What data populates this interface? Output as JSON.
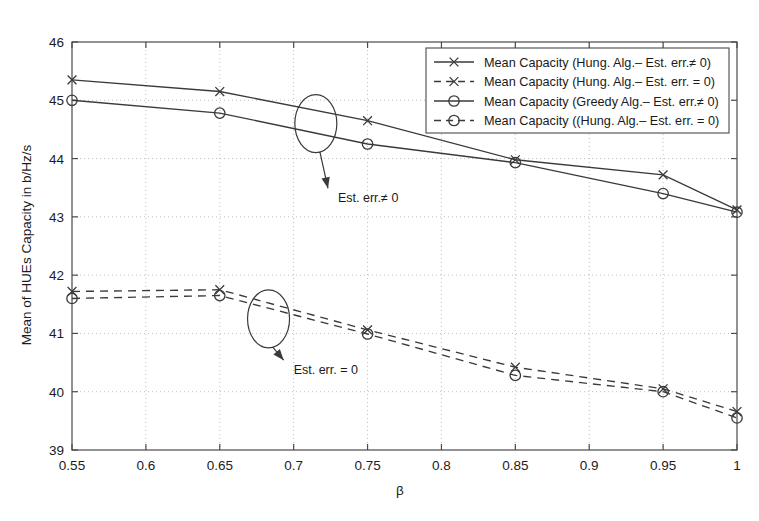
{
  "chart_data": {
    "type": "line",
    "title": "",
    "xlabel": "β",
    "ylabel": "Mean of HUEs Capacity in b/Hz/s",
    "xlim": [
      0.55,
      1.0
    ],
    "ylim": [
      39,
      46
    ],
    "xticks": [
      0.55,
      0.6,
      0.65,
      0.7,
      0.75,
      0.8,
      0.85,
      0.9,
      0.95,
      1.0
    ],
    "xticklabels": [
      "0.55",
      "0.6",
      "0.65",
      "0.7",
      "0.75",
      "0.8",
      "0.85",
      "0.9",
      "0.95",
      "1"
    ],
    "yticks": [
      39,
      40,
      41,
      42,
      43,
      44,
      45,
      46
    ],
    "yticklabels": [
      "39",
      "40",
      "41",
      "42",
      "43",
      "44",
      "45",
      "46"
    ],
    "grid": true,
    "grid_style": "dotted",
    "legend_position": "upper right",
    "x": [
      0.55,
      0.65,
      0.75,
      0.85,
      0.95,
      1.0
    ],
    "series": [
      {
        "name": "Mean Capacity (Hung. Alg.– Est. err.≠ 0)",
        "marker": "x",
        "linestyle": "solid",
        "values": [
          45.35,
          45.15,
          44.65,
          43.98,
          43.72,
          43.12
        ]
      },
      {
        "name": "Mean Capacity (Hung. Alg.– Est. err. = 0)",
        "marker": "x",
        "linestyle": "dashed",
        "values": [
          41.72,
          41.75,
          41.06,
          40.42,
          40.05,
          39.66
        ]
      },
      {
        "name": "Mean Capacity (Greedy Alg.– Est. err.≠ 0)",
        "marker": "o",
        "linestyle": "solid",
        "values": [
          45.0,
          44.78,
          44.25,
          43.93,
          43.4,
          43.08
        ]
      },
      {
        "name": "Mean Capacity ((Hung. Alg.– Est. err. = 0)",
        "marker": "o",
        "linestyle": "dashed",
        "values": [
          41.6,
          41.65,
          40.99,
          40.28,
          40.0,
          39.55
        ]
      }
    ],
    "annotations": [
      {
        "text": "Est. err.≠ 0",
        "x": 0.715,
        "y": 44.6,
        "label_x": 0.73,
        "label_y": 43.25,
        "marker": "ellipse"
      },
      {
        "text": "Est. err. = 0",
        "x": 0.683,
        "y": 41.25,
        "label_x": 0.7,
        "label_y": 40.3,
        "marker": "ellipse"
      }
    ],
    "colors": {
      "line": "#3a3a3a",
      "grid": "#bdbdbd",
      "axis": "#4a4a4a",
      "text": "#1a1a1a",
      "background": "#ffffff"
    }
  }
}
